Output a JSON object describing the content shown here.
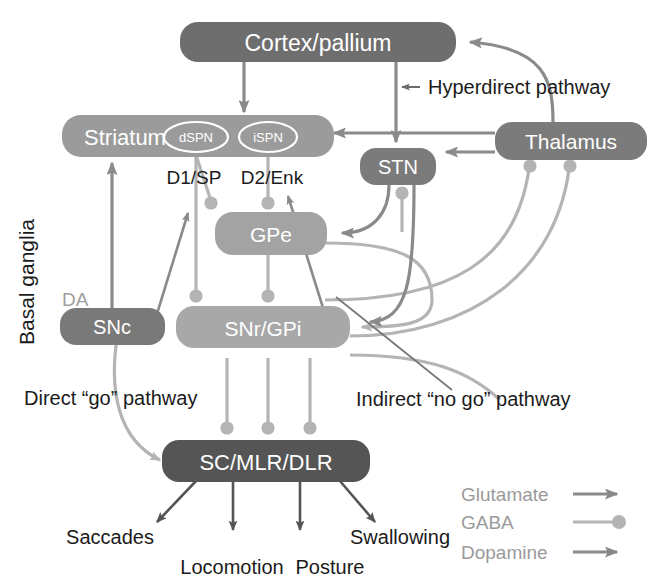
{
  "figure": {
    "side_label": "Basal ganglia",
    "dopamine_label": "DA"
  },
  "nodes": {
    "cortex": {
      "label": "Cortex/pallium"
    },
    "striatum": {
      "label": "Striatum"
    },
    "dspn": {
      "label": "dSPN"
    },
    "ispn": {
      "label": "iSPN"
    },
    "d1sp": {
      "label": "D1/SP"
    },
    "d2enk": {
      "label": "D2/Enk"
    },
    "stn": {
      "label": "STN"
    },
    "thalamus": {
      "label": "Thalamus"
    },
    "gpe": {
      "label": "GPe"
    },
    "snc": {
      "label": "SNc"
    },
    "snrgpi": {
      "label": "SNr/GPi"
    },
    "scmlrdlr": {
      "label": "SC/MLR/DLR"
    }
  },
  "pathways": {
    "hyperdirect": "Hyperdirect  pathway",
    "direct": "Direct “go” pathway",
    "indirect": "Indirect “no go” pathway"
  },
  "outputs": [
    {
      "label": "Saccades"
    },
    {
      "label": "Locomotion"
    },
    {
      "label": "Posture"
    },
    {
      "label": "Swallowing"
    }
  ],
  "legend": {
    "items": [
      {
        "label": "Glutamate",
        "symbol": "arrow"
      },
      {
        "label": "GABA",
        "symbol": "ball"
      },
      {
        "label": "Dopamine",
        "symbol": "arrow"
      }
    ]
  },
  "colors": {
    "dark_node": "#6e6e6e",
    "mid_node": "#8c8c8c",
    "light_node": "#adadad",
    "darkest_node": "#5c5c5c",
    "glutamate": "#8a8a8a",
    "gaba": "#b4b4b4",
    "dopamine": "#8a8a8a",
    "text_black": "#1b1b1b",
    "text_gray": "#9a9a9a"
  }
}
